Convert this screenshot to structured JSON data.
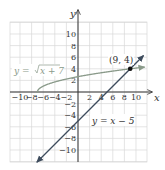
{
  "chart_data": {
    "type": "line",
    "title": "",
    "xlabel": "x",
    "ylabel": "y",
    "xlim": [
      -11.7,
      11.7
    ],
    "ylim": [
      -12,
      12
    ],
    "grid": true,
    "grid_step": 2,
    "x_ticks": [
      -10,
      -8,
      -6,
      -4,
      -2,
      2,
      4,
      6,
      8,
      10
    ],
    "y_ticks": [
      10,
      8,
      6,
      4,
      2,
      -2,
      -4,
      -6,
      -8,
      -10
    ],
    "x_tick_labels": [
      "−10",
      "−8",
      "−6",
      "−4",
      "−2",
      "2",
      "4",
      "6",
      "8",
      "10"
    ],
    "y_tick_labels": [
      "10",
      "8",
      "6",
      "4",
      "2",
      "−2",
      "−4",
      "−6",
      "−8",
      "−10"
    ],
    "series": [
      {
        "name": "y = √(x + 7)",
        "function": "sqrt(x+7)",
        "domain": [
          -7,
          11.5
        ],
        "color": "#8a9a8a"
      },
      {
        "name": "y = x − 5",
        "function": "x-5",
        "domain": [
          -7,
          12
        ],
        "color": "#3d4b5c"
      }
    ],
    "annotations": [
      {
        "text": "(9, 4)",
        "x": 9,
        "y": 4,
        "type": "intersection-point"
      }
    ]
  },
  "labels": {
    "x_axis": "x",
    "y_axis": "y",
    "sqrt_eq_prefix": "y = ",
    "sqrt_eq_body": "x + 7",
    "linear_eq": "y = x − 5",
    "point": "(9, 4)"
  }
}
